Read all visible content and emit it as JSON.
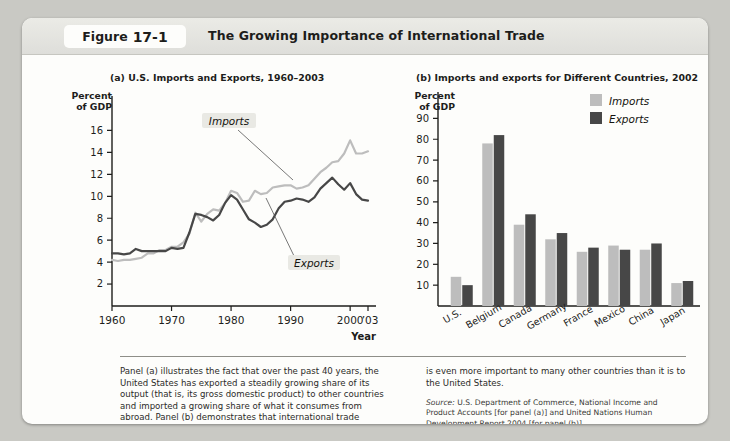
{
  "header": {
    "badge_word": "Figure",
    "badge_number": "17-1",
    "title": "The Growing Importance of International Trade"
  },
  "panel_a": {
    "title": "(a) U.S. Imports and Exports, 1960–2003",
    "y_axis_title": "Percent\nof GDP",
    "x_axis_title": "Year",
    "label_imports": "Imports",
    "label_exports": "Exports"
  },
  "panel_b": {
    "title": "(b) Imports and exports for Different Countries, 2002",
    "y_axis_title": "Percent\nof GDP",
    "legend": [
      "Imports",
      "Exports"
    ]
  },
  "caption": {
    "left": "Panel (a) illustrates the fact that over the past 40 years, the United States has exported a steadily growing share of its output (that is, its gross domestic product) to other countries and imported a growing share of what it consumes from abroad. Panel (b) demonstrates that international trade",
    "right": "is even more important to many other countries than it is to the United States.",
    "source_label": "Source:",
    "source_text": " U.S. Department of Commerce, National Income and Product Accounts [for panel (a)] and United Nations Human Development Report 2004 [for panel (b)]."
  },
  "colors": {
    "imports": "#bdbdbd",
    "exports": "#474747",
    "axis": "#1d1d1b",
    "card": "#fdfdfb",
    "page": "#c9c9c4"
  },
  "chart_data": [
    {
      "type": "line",
      "title": "(a) U.S. Imports and Exports, 1960–2003",
      "xlabel": "Year",
      "ylabel": "Percent of GDP",
      "xlim": [
        1960,
        2003
      ],
      "ylim": [
        0,
        17.5
      ],
      "yticks": [
        2,
        4,
        6,
        8,
        10,
        12,
        14,
        16
      ],
      "xticks": [
        1960,
        1970,
        1980,
        1990,
        2000
      ],
      "xtick_labels": [
        "1960",
        "1970",
        "1980",
        "1990",
        "2000",
        "’03"
      ],
      "grid": false,
      "legend": "inline-annotations",
      "x": [
        1960,
        1961,
        1962,
        1963,
        1964,
        1965,
        1966,
        1967,
        1968,
        1969,
        1970,
        1971,
        1972,
        1973,
        1974,
        1975,
        1976,
        1977,
        1978,
        1979,
        1980,
        1981,
        1982,
        1983,
        1984,
        1985,
        1986,
        1987,
        1988,
        1989,
        1990,
        1991,
        1992,
        1993,
        1994,
        1995,
        1996,
        1997,
        1998,
        1999,
        2000,
        2001,
        2002,
        2003
      ],
      "series": [
        {
          "name": "Imports",
          "color": "#bdbdbd",
          "values": [
            4.2,
            4.1,
            4.2,
            4.2,
            4.3,
            4.4,
            4.8,
            4.8,
            5.1,
            5.1,
            5.4,
            5.4,
            5.8,
            6.6,
            8.5,
            7.7,
            8.4,
            8.8,
            8.7,
            9.4,
            10.5,
            10.3,
            9.5,
            9.6,
            10.5,
            10.2,
            10.3,
            10.8,
            10.9,
            11.0,
            11.0,
            10.7,
            10.8,
            11.0,
            11.6,
            12.2,
            12.6,
            13.1,
            13.2,
            13.9,
            15.1,
            13.9,
            13.9,
            14.1
          ]
        },
        {
          "name": "Exports",
          "color": "#474747",
          "values": [
            4.8,
            4.8,
            4.7,
            4.8,
            5.2,
            5.0,
            5.0,
            5.0,
            5.0,
            5.0,
            5.3,
            5.2,
            5.3,
            6.7,
            8.4,
            8.3,
            8.1,
            7.8,
            8.3,
            9.4,
            10.1,
            9.7,
            8.8,
            7.9,
            7.6,
            7.2,
            7.4,
            7.9,
            8.9,
            9.5,
            9.6,
            9.8,
            9.7,
            9.5,
            9.9,
            10.7,
            11.2,
            11.7,
            11.1,
            10.6,
            11.2,
            10.2,
            9.7,
            9.6
          ]
        }
      ]
    },
    {
      "type": "bar",
      "title": "(b) Imports and exports for Different Countries, 2002",
      "xlabel": "",
      "ylabel": "Percent of GDP",
      "ylim": [
        0,
        95
      ],
      "yticks": [
        10,
        20,
        30,
        40,
        50,
        60,
        70,
        80,
        90
      ],
      "grid": false,
      "legend_position": "top-right",
      "categories": [
        "U.S.",
        "Belgium",
        "Canada",
        "Germany",
        "France",
        "Mexico",
        "China",
        "Japan"
      ],
      "series": [
        {
          "name": "Imports",
          "color": "#bdbdbd",
          "values": [
            14,
            78,
            39,
            32,
            26,
            29,
            27,
            11
          ]
        },
        {
          "name": "Exports",
          "color": "#474747",
          "values": [
            10,
            82,
            44,
            35,
            28,
            27,
            30,
            12
          ]
        }
      ]
    }
  ]
}
